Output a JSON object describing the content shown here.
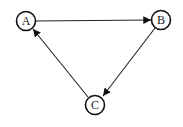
{
  "diagram": {
    "type": "directed-graph",
    "nodes": [
      {
        "id": "A",
        "label": "A",
        "cx": 26,
        "cy": 21
      },
      {
        "id": "B",
        "label": "B",
        "cx": 161,
        "cy": 20
      },
      {
        "id": "C",
        "label": "C",
        "cx": 95,
        "cy": 105
      }
    ],
    "edges": [
      {
        "from": "A",
        "to": "B"
      },
      {
        "from": "B",
        "to": "C"
      },
      {
        "from": "C",
        "to": "A"
      }
    ],
    "colors": {
      "stroke": "#111111",
      "background": "#ffffff"
    }
  }
}
